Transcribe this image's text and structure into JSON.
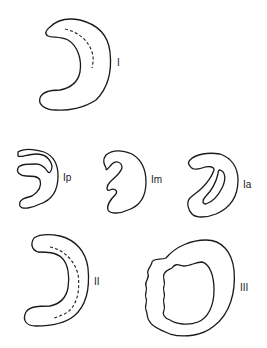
{
  "figure": {
    "type": "line-drawing"
  },
  "shapes": [
    {
      "id": "I",
      "label": "I",
      "style": "crescent with dashed inner line"
    },
    {
      "id": "Ip",
      "label": "Ip",
      "style": "crescent with posterior inner fold"
    },
    {
      "id": "Im",
      "label": "Im",
      "style": "crescent with medial indentation"
    },
    {
      "id": "Ia",
      "label": "Ia",
      "style": "crescent with anterior inner fold"
    },
    {
      "id": "II",
      "label": "II",
      "style": "crescent with dashed inner line"
    },
    {
      "id": "III",
      "label": "III",
      "style": "ring with irregular wavy edges"
    }
  ],
  "colors": {
    "stroke": "#1a1a1a",
    "background": "#ffffff"
  }
}
